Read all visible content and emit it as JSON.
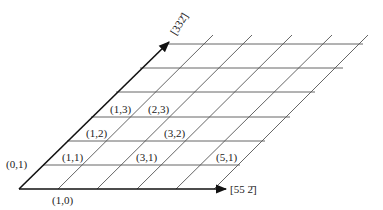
{
  "diagram": {
    "type": "oblique lattice grid",
    "axes": {
      "horizontal": {
        "label": "[55 2̄]",
        "direction": "right"
      },
      "oblique": {
        "label": "[332̄]",
        "direction": "up-right 45deg"
      }
    },
    "point_labels": [
      {
        "text": "(0,1)",
        "x": 21,
        "y": 168
      },
      {
        "text": "(1,1)",
        "x": 74,
        "y": 160
      },
      {
        "text": "(3,1)",
        "x": 146,
        "y": 160
      },
      {
        "text": "(5,1)",
        "x": 229,
        "y": 160
      },
      {
        "text": "(1,2)",
        "x": 97,
        "y": 136
      },
      {
        "text": "(3,2)",
        "x": 175,
        "y": 136
      },
      {
        "text": "(1,3)",
        "x": 121,
        "y": 112
      },
      {
        "text": "(2,3)",
        "x": 157,
        "y": 112
      },
      {
        "text": "(1,0)",
        "x": 59,
        "y": 203
      }
    ],
    "colors": {
      "axis": "#111111",
      "grid": "#555555",
      "text": "#222222",
      "background": "#ffffff"
    }
  }
}
